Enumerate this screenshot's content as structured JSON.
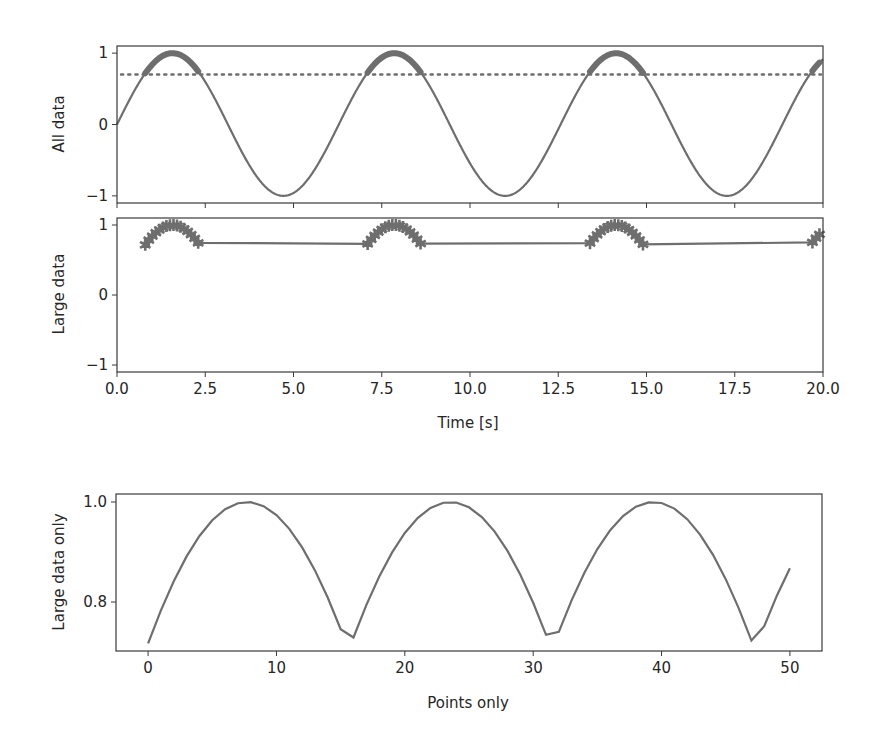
{
  "figure": {
    "width": 886,
    "height": 744,
    "background": "#ffffff"
  },
  "colors": {
    "line": "#6e6e6e",
    "axes": "#3a3a3a",
    "text": "#262626"
  },
  "chart_data": [
    {
      "id": "all-data",
      "type": "line",
      "title": "",
      "xlabel": "",
      "ylabel": "All data",
      "xlim": [
        0,
        20
      ],
      "ylim": [
        -1.1,
        1.1
      ],
      "xticks": [
        0,
        2.5,
        5,
        7.5,
        10,
        12.5,
        15,
        17.5,
        20
      ],
      "xtick_labels_visible": false,
      "yticks": [
        -1,
        0,
        1
      ],
      "ytick_labels": [
        "−1",
        "0",
        "1"
      ],
      "grid": false,
      "series": [
        {
          "name": "sin(t)",
          "function": "sin",
          "t_start": 0,
          "t_stop": 20,
          "t_step": 0.1,
          "style": "solid"
        },
        {
          "name": "large data",
          "function": "sin",
          "filter": "> 0.7",
          "t_step": 0.1,
          "style": "solid",
          "overlay_thick": true
        },
        {
          "name": "threshold",
          "type": "hline",
          "y": 0.7,
          "style": "dotted"
        }
      ]
    },
    {
      "id": "large-data",
      "type": "line",
      "xlabel": "Time [s]",
      "ylabel": "Large data",
      "xlim": [
        0,
        20
      ],
      "ylim": [
        -1.1,
        1.1
      ],
      "xticks": [
        0,
        2.5,
        5,
        7.5,
        10,
        12.5,
        15,
        17.5,
        20
      ],
      "xtick_labels": [
        "0.0",
        "2.5",
        "5.0",
        "7.5",
        "10.0",
        "12.5",
        "15.0",
        "17.5",
        "20.0"
      ],
      "yticks": [
        -1,
        0,
        1
      ],
      "ytick_labels": [
        "−1",
        "0",
        "1"
      ],
      "grid": false,
      "marker": "star",
      "series": [
        {
          "name": "large data",
          "t_values": [
            0.8,
            0.9,
            1.0,
            1.1,
            1.2,
            1.3,
            1.4,
            1.5,
            1.6,
            1.7,
            1.8,
            1.9,
            2.0,
            2.1,
            2.2,
            2.3,
            7.1,
            7.2,
            7.3,
            7.4,
            7.5,
            7.6,
            7.7,
            7.8,
            7.9,
            8.0,
            8.1,
            8.2,
            8.3,
            8.4,
            8.5,
            8.6,
            13.4,
            13.5,
            13.6,
            13.7,
            13.8,
            13.9,
            14.0,
            14.1,
            14.2,
            14.3,
            14.4,
            14.5,
            14.6,
            14.7,
            14.8,
            14.9,
            19.7,
            19.8,
            19.9
          ]
        }
      ]
    },
    {
      "id": "large-data-only",
      "type": "line",
      "xlabel": "Points only",
      "ylabel": "Large data only",
      "xlim": [
        -2.5,
        52.5
      ],
      "ylim": [
        0.702,
        1.016
      ],
      "xticks": [
        0,
        10,
        20,
        30,
        40,
        50
      ],
      "xtick_labels": [
        "0",
        "10",
        "20",
        "30",
        "40",
        "50"
      ],
      "yticks": [
        0.8,
        1.0
      ],
      "ytick_labels": [
        "0.8",
        "1.0"
      ],
      "grid": false,
      "series": [
        {
          "name": "large data by index",
          "x": "0..50",
          "values_from": "large-data.t_values (sin)"
        }
      ]
    }
  ],
  "axes_labels": {
    "all_data": "All data",
    "large_data": "Large data",
    "time": "Time [s]",
    "large_data_only": "Large data only",
    "points_only": "Points only"
  }
}
